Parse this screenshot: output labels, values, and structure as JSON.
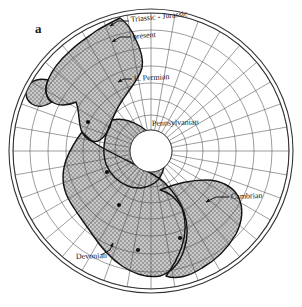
{
  "figure": {
    "panel_label": "a",
    "type": "polar-stereographic-map",
    "background_color": "#ffffff",
    "ink_color": "#1a1a1a",
    "continent_fill_color": "#b9b9b9",
    "stipple_color": "#6e6e6e",
    "grid_color": "#555555",
    "outer_circle_color": "#333333"
  },
  "labels": [
    {
      "id": "triassic-jurassic",
      "text": "Triassic - Jurassic",
      "x": 131,
      "y": 22,
      "anchor": "start",
      "size": 8.0,
      "rotate": -6
    },
    {
      "id": "present",
      "text": "present",
      "x": 133,
      "y": 39,
      "anchor": "start",
      "size": 8.0,
      "rotate": -5
    },
    {
      "id": "l-permian",
      "text": "L. Permian",
      "x": 134,
      "y": 81,
      "anchor": "start",
      "size": 8.0,
      "rotate": -3
    },
    {
      "id": "pennsylvanian",
      "text": "Pennsylvanian",
      "x": 152,
      "y": 126,
      "anchor": "start",
      "size": 8.0,
      "rotate": -2
    },
    {
      "id": "cambrian",
      "text": "Cambrian",
      "x": 231,
      "y": 199,
      "anchor": "start",
      "size": 8.0,
      "rotate": -2
    },
    {
      "id": "devonian",
      "text": "Devonian",
      "x": 76,
      "y": 259,
      "anchor": "start",
      "size": 8.0,
      "rotate": -2
    }
  ],
  "leaders": [
    {
      "id": "leader-triassic-jurassic",
      "path": "M129,21 L118,21 L110,26",
      "arrow": [
        110,
        26,
        -30
      ]
    },
    {
      "id": "leader-present",
      "path": "M131,37 L120,37 L112,42",
      "arrow": [
        112,
        42,
        -30
      ]
    },
    {
      "id": "leader-l-permian",
      "path": "M132,79 L124,79 L118,82",
      "arrow": [
        118,
        82,
        -25
      ]
    },
    {
      "id": "leader-cambrian",
      "path": "M229,197 L216,197 L206,202",
      "arrow": [
        206,
        202,
        -200
      ]
    },
    {
      "id": "leader-devonian",
      "path": "M101,255 L110,250 L113,243",
      "arrow": [
        113,
        243,
        70
      ]
    }
  ],
  "pole_points": [
    {
      "id": "pole-present",
      "x": 88,
      "y": 122
    },
    {
      "id": "pole-l-permian",
      "x": 107,
      "y": 172
    },
    {
      "id": "pole-pennsylvanian",
      "x": 119,
      "y": 205
    },
    {
      "id": "pole-devonian",
      "x": 138,
      "y": 250
    },
    {
      "id": "pole-cambrian",
      "x": 180,
      "y": 238
    }
  ],
  "geometry": {
    "center_x": 151,
    "center_y": 151,
    "outer_radius": 142,
    "outer_radius_inner": 138,
    "polar_hole_radius": 21,
    "latitude_rings": [
      21,
      36,
      52,
      68,
      85,
      103,
      121,
      138
    ],
    "meridian_count": 36
  },
  "continents": {
    "description": "Stippled continental landmass outlines on a polar stereographic reconstruction",
    "outlines": [
      {
        "id": "north-america-block",
        "path": "M120,18 C112,22 104,26 96,31 C88,37 78,43 70,51 C60,60 52,70 48,80 C44,90 46,98 52,102 C58,106 68,106 76,102 C80,112 78,124 82,132 C86,140 94,144 100,140 C106,136 110,128 112,120 C116,110 122,100 128,92 C134,84 140,76 142,68 C144,58 140,48 136,40 C132,30 126,22 120,18 Z"
      },
      {
        "id": "north-west-arm",
        "path": "M48,80 C40,78 32,80 28,86 C24,92 26,100 32,104 C38,108 46,106 52,102 C46,98 44,90 48,80 Z"
      },
      {
        "id": "south-america-block",
        "path": "M82,132 C76,140 70,150 66,160 C62,172 62,186 68,198 C74,210 84,222 92,234 C100,246 110,258 122,266 C134,274 148,278 160,276 C172,272 180,262 184,250 C188,238 188,224 184,212 C180,200 172,190 164,182 C154,174 142,168 130,162 C118,156 106,150 96,144 C90,140 86,136 82,132 Z"
      },
      {
        "id": "africa-gondwana-block",
        "path": "M160,190 C174,184 190,180 206,180 C220,180 232,186 238,196 C244,208 242,222 236,234 C228,248 216,260 202,268 C190,276 176,280 166,276 C172,268 178,258 182,246 C186,234 186,220 182,208 C176,198 168,192 160,190 Z"
      },
      {
        "id": "central-bridge",
        "path": "M112,120 C120,118 130,120 140,126 C150,132 158,142 162,152 C166,162 164,172 158,180 C150,188 138,190 128,186 C118,182 110,174 106,164 C102,152 104,136 112,120 Z"
      }
    ]
  }
}
